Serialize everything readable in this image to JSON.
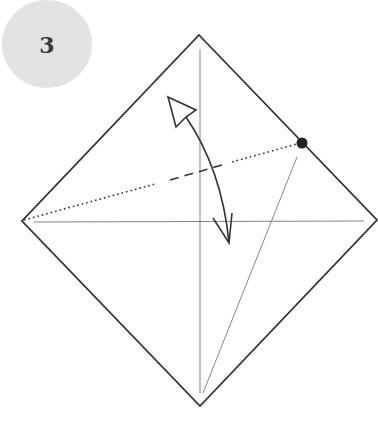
{
  "step": {
    "number": "3"
  },
  "colors": {
    "outline": "#333333",
    "crease": "#555555",
    "badge": "#e3e3e3",
    "dot": "#222222"
  },
  "diagram": {
    "square_corners": {
      "top": [
        199,
        35
      ],
      "right": [
        377,
        220
      ],
      "bottom": [
        200,
        406
      ],
      "left": [
        22,
        221
      ]
    },
    "creases": [
      {
        "name": "vertical-crease",
        "from": [
          200,
          49
        ],
        "to": [
          200,
          393
        ]
      },
      {
        "name": "horizontal-crease",
        "from": [
          34,
          222
        ],
        "to": [
          364,
          221
        ]
      },
      {
        "name": "diagonal-crease",
        "from": [
          297,
          157
        ],
        "to": [
          203,
          393
        ]
      }
    ],
    "fold_line": {
      "from": [
        22,
        221
      ],
      "to": [
        302,
        143
      ],
      "style": "dotted-dashed-dotted"
    },
    "reference_dot": [
      302,
      143
    ],
    "arrow": {
      "type": "fold-and-unfold",
      "start": [
        229,
        243
      ],
      "end": [
        170,
        99
      ]
    }
  }
}
